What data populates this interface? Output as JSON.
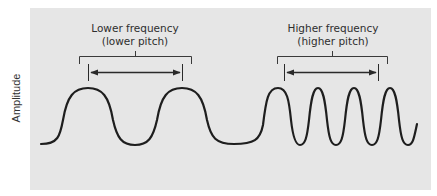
{
  "diagram": {
    "y_axis_label": "Amplitude",
    "left_section": {
      "title": "Lower frequency",
      "subtitle": "(lower pitch)",
      "cycles_shown": 2
    },
    "right_section": {
      "title": "Higher frequency",
      "subtitle": "(higher pitch)",
      "cycles_shown": 5
    },
    "colors": {
      "panel_background": "#e6e6e6",
      "wave_stroke": "#1e1e1e",
      "annotation_stroke": "#333333",
      "text": "#2e2e2e"
    }
  }
}
